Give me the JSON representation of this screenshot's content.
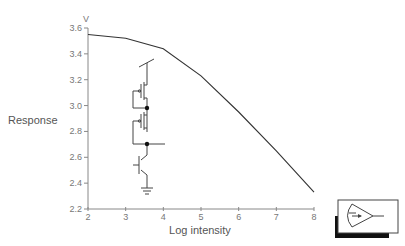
{
  "chart_data": {
    "type": "line",
    "title": "",
    "xlabel": "Log intensity",
    "ylabel": "Response",
    "yunit": "V",
    "xlim": [
      2,
      8
    ],
    "ylim": [
      2.2,
      3.6
    ],
    "xticks": [
      "2",
      "3",
      "4",
      "5",
      "6",
      "7",
      "8"
    ],
    "yticks": [
      "2.2",
      "2.4",
      "2.6",
      "2.8",
      "3.0",
      "3.2",
      "3.4",
      "3.6"
    ],
    "grid": false,
    "legend": null,
    "series": [
      {
        "name": "Response",
        "x": [
          2,
          3,
          4,
          5,
          6,
          7,
          8
        ],
        "y": [
          3.55,
          3.52,
          3.44,
          3.23,
          2.95,
          2.65,
          2.33
        ]
      }
    ],
    "annotations": [
      "circuit schematic inset (two MOS transistors stacked over bipolar phototransistor to ground)",
      "photoreceptor symbol icon in bordered box, bottom right"
    ]
  },
  "colors": {
    "line": "#333333",
    "axis": "#888888",
    "text": "#666666"
  }
}
